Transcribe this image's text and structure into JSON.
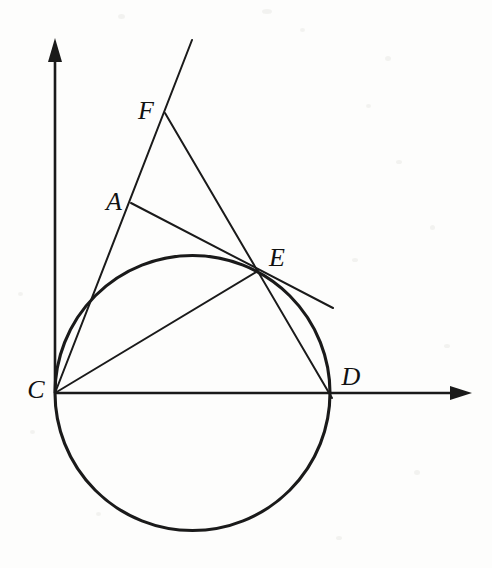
{
  "figure": {
    "background_color": "#fdfdfc",
    "stroke_color": "#1a1a1a",
    "axis_color": "#1a1a1a",
    "width": 492,
    "height": 568
  },
  "axes": {
    "origin": {
      "x": 55,
      "y": 393
    },
    "x_axis": {
      "from_x": 55,
      "from_y": 393,
      "to_x": 470,
      "to_y": 393,
      "arrow": "right"
    },
    "y_axis": {
      "from_x": 55,
      "from_y": 393,
      "to_x": 55,
      "to_y": 40,
      "arrow": "up"
    }
  },
  "circle": {
    "center_x": 192.5,
    "center_y": 393,
    "radius": 137.5,
    "stroke_width": 3.1
  },
  "points": [
    {
      "id": "A",
      "label": "A",
      "x": 131,
      "y": 203,
      "label_x": 114,
      "label_y": 202
    },
    {
      "id": "C",
      "label": "C",
      "x": 55,
      "y": 393,
      "label_x": 36,
      "label_y": 390
    },
    {
      "id": "D",
      "label": "D",
      "x": 330,
      "y": 393,
      "label_x": 351,
      "label_y": 377
    },
    {
      "id": "E",
      "label": "E",
      "x": 258,
      "y": 271,
      "label_x": 277,
      "label_y": 258
    },
    {
      "id": "F",
      "label": "F",
      "x": 165,
      "y": 113,
      "label_x": 146,
      "label_y": 111
    }
  ],
  "segments": [
    {
      "id": "line-C-F-extended",
      "name": "secant-C-through-A-F",
      "x1": 55,
      "y1": 393,
      "x2": 192,
      "y2": 40,
      "stroke_width": 2.0
    },
    {
      "id": "line-F-D",
      "name": "secant-F-through-E-D",
      "x1": 165,
      "y1": 113,
      "x2": 332,
      "y2": 398,
      "stroke_width": 2.0
    },
    {
      "id": "line-A-E-tangent",
      "name": "tangent-A-through-E",
      "x1": 131,
      "y1": 203,
      "x2": 333,
      "y2": 308,
      "stroke_width": 2.0
    },
    {
      "id": "chord-C-E",
      "name": "chord-C-to-E",
      "x1": 55,
      "y1": 393,
      "x2": 258,
      "y2": 271,
      "stroke_width": 2.0
    }
  ],
  "arrowheads": {
    "x_tip_x": 470,
    "x_tip_y": 393,
    "y_tip_x": 55,
    "y_tip_y": 40
  }
}
